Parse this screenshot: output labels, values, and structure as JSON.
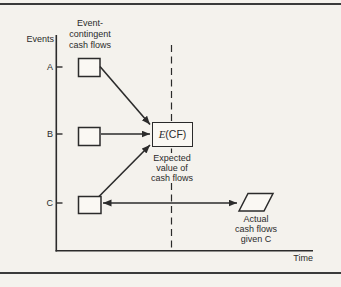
{
  "colors": {
    "background": "#f4f2ed",
    "ink": "#2b2b2b",
    "box_fill": "#faf8f3",
    "rule": "#3a3a3a"
  },
  "axis": {
    "y_label": "Events",
    "x_label": "Time"
  },
  "header_caption": {
    "line1": "Event-",
    "line2": "contingent",
    "line3": "cash flows"
  },
  "event_ticks": {
    "a": "A",
    "b": "B",
    "c": "C"
  },
  "ecf_node": {
    "symbol": "E",
    "args": "(CF)"
  },
  "expected_caption": {
    "line1": "Expected",
    "line2": "value of",
    "line3": "cash flows"
  },
  "actual_caption": {
    "line1": "Actual",
    "line2": "cash flows",
    "line3": "given C"
  },
  "diagram": {
    "type": "flow-diagram",
    "nodes": [
      {
        "id": "box-a",
        "event": "A",
        "kind": "event-contingent cash flow box"
      },
      {
        "id": "box-b",
        "event": "B",
        "kind": "event-contingent cash flow box"
      },
      {
        "id": "box-c",
        "event": "C",
        "kind": "event-contingent cash flow box"
      },
      {
        "id": "ecf",
        "label": "E(CF)",
        "caption": "Expected value of cash flows",
        "shape": "rectangle"
      },
      {
        "id": "actual",
        "caption": "Actual cash flows given C",
        "shape": "parallelogram"
      }
    ],
    "edges": [
      {
        "from": "box-a",
        "to": "ecf",
        "arrow": "single"
      },
      {
        "from": "box-b",
        "to": "ecf",
        "arrow": "single"
      },
      {
        "from": "box-c",
        "to": "ecf",
        "arrow": "single"
      },
      {
        "from": "box-c",
        "to": "actual",
        "arrow": "double"
      }
    ],
    "dashed_divider": "vertical dashed line through E(CF)"
  }
}
